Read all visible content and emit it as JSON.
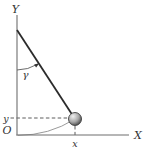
{
  "figure": {
    "labels": {
      "y_axis": "Y",
      "x_axis": "X",
      "origin": "O",
      "angle": "γ",
      "x_coord": "x",
      "y_coord": "y"
    },
    "colors": {
      "background": "#ffffff",
      "axis": "#6e6e6e",
      "string": "#2b2b2b",
      "dashed_line": "#4a4a4a",
      "angle_arc": "#5a5a5a",
      "trajectory_arc": "#8f8f8f",
      "label_text": "#333333",
      "ball_highlight": "#f0f0f0",
      "ball_mid": "#a8a8a8",
      "ball_shadow": "#404040"
    }
  }
}
